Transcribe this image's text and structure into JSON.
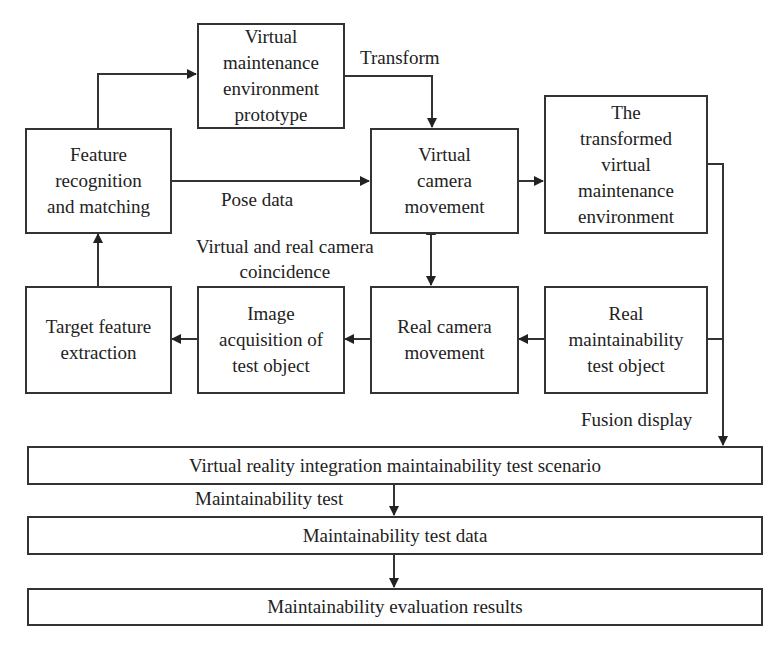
{
  "diagram": {
    "nodes": {
      "prototype": "Virtual\nmaintenance\nenvironment\nprototype",
      "feature_matching": "Feature\nrecognition\nand matching",
      "virtual_camera": "Virtual\ncamera\nmovement",
      "transformed_env": "The\ntransformed\nvirtual\nmaintenance\nenvironment",
      "target_extraction": "Target feature\nextraction",
      "image_acquisition": "Image\nacquisition of\ntest object",
      "real_camera": "Real camera\nmovement",
      "real_object": "Real\nmaintainability\ntest object",
      "vr_scenario": "Virtual reality integration maintainability test scenario",
      "test_data": "Maintainability test data",
      "evaluation": "Maintainability evaluation results"
    },
    "edge_labels": {
      "transform": "Transform",
      "pose_data": "Pose data",
      "coincidence": "Virtual and real camera\ncoincidence",
      "fusion_display": "Fusion display",
      "maintainability_test": "Maintainability test"
    },
    "colors": {
      "line": "#333333",
      "background": "#ffffff"
    }
  }
}
